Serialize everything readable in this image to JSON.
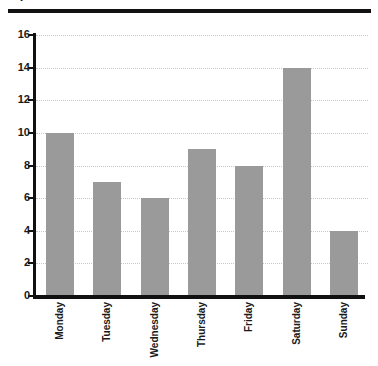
{
  "header": {
    "title_fragment": "y",
    "rule_color": "#111111"
  },
  "chart_data": {
    "type": "bar",
    "title": "",
    "xlabel": "",
    "ylabel": "",
    "categories": [
      "Monday",
      "Tuesday",
      "Wednesday",
      "Thursday",
      "Friday",
      "Saturday",
      "Sunday"
    ],
    "values": [
      10,
      7,
      6,
      9,
      8,
      14,
      4
    ],
    "ylim": [
      0,
      16
    ],
    "ytick_labels": [
      "0",
      "2",
      "4",
      "6",
      "8",
      "10",
      "12",
      "14",
      "16"
    ],
    "ytick_values": [
      0,
      2,
      4,
      6,
      8,
      10,
      12,
      14,
      16
    ],
    "grid": true,
    "grid_axis": "y",
    "grid_style": "dotted",
    "grid_color": "#c8c8c8",
    "legend": false,
    "bar_color": "#9a9a9a",
    "axis_color": "#111111",
    "background": "#ffffff",
    "xlabel_rotation": 90
  }
}
